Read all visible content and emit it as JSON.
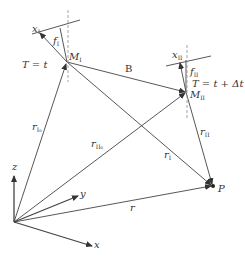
{
  "diagram": {
    "type": "vector-geometry",
    "colors": {
      "line": "#444444",
      "dashed": "#999999",
      "background": "#ffffff"
    },
    "points": {
      "origin": {
        "x": 14,
        "y": 222
      },
      "M_I": {
        "x": 67,
        "y": 62
      },
      "M_II": {
        "x": 186,
        "y": 92
      },
      "P": {
        "x": 213,
        "y": 186
      }
    },
    "labels": {
      "x_I": {
        "main": "x",
        "sub": "I"
      },
      "f_I": {
        "main": "f",
        "sub": "I"
      },
      "M_I": {
        "main": "M",
        "sub": "I"
      },
      "T_I": "T = t",
      "B": "B",
      "x_II": {
        "main": "x",
        "sub": "II"
      },
      "f_II": {
        "main": "f",
        "sub": "II"
      },
      "T_II": "T = t + Δt",
      "M_II": {
        "main": "M",
        "sub": "II"
      },
      "r_I0": {
        "main": "r",
        "sub": "I₀"
      },
      "r_II0": {
        "main": "r",
        "sub": "II₀"
      },
      "r_I": {
        "main": "r",
        "sub": "I"
      },
      "r_II": {
        "main": "r",
        "sub": "II"
      },
      "r": "r",
      "P": "P",
      "axis_x": "x",
      "axis_y": "y",
      "axis_z": "z"
    }
  }
}
